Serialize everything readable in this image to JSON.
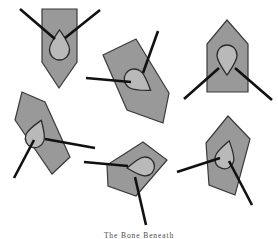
{
  "figure": {
    "title": "",
    "caption": "The Bone Beneath",
    "background_color": "#ffffff",
    "width": 278,
    "height": 239,
    "palette": {
      "polygon_fill": "#999999",
      "polygon_stroke": "#3a3a3a",
      "teardrop_fill": "#b9b9b9",
      "teardrop_stroke": "#2b2b2b",
      "leader_line": "#111111"
    },
    "object_count": 6,
    "leader_lines_per_object": 2,
    "objects": [
      {
        "id": "object-1",
        "name": "shield-top-left",
        "position": "top-left",
        "rotation_deg": 0,
        "polygon_kind": "shield-pointed-bottom",
        "polygon_points": "42,9 77,9 77,62 59,88 42,62",
        "teardrop": {
          "cx": 59.5,
          "cy": 43,
          "rx": 10,
          "ry": 13,
          "rotation_deg": 0
        },
        "leaders": [
          {
            "x1": 20,
            "y1": 9,
            "x2": 55,
            "y2": 39
          },
          {
            "x1": 100,
            "y1": 10,
            "x2": 65,
            "y2": 38
          }
        ]
      },
      {
        "id": "object-2",
        "name": "shield-top-middle",
        "position": "top-middle",
        "rotation_deg": 40,
        "polygon_kind": "shield-pointed-bottom",
        "polygon_points": "136,39 103,55 127,110 163,123 169,93",
        "teardrop": {
          "cx": 140,
          "cy": 83,
          "rx": 10,
          "ry": 12.5,
          "rotation_deg": 125
        },
        "leaders": [
          {
            "x1": 158,
            "y1": 31,
            "x2": 143,
            "y2": 73
          },
          {
            "x1": 86,
            "y1": 78,
            "x2": 131,
            "y2": 82
          }
        ]
      },
      {
        "id": "object-3",
        "name": "shield-top-right",
        "position": "top-right",
        "rotation_deg": 180,
        "polygon_kind": "house-pointed-top",
        "polygon_points": "227,20 248,44 248,92 207,92 207,44",
        "teardrop": {
          "cx": 227,
          "cy": 62,
          "rx": 10,
          "ry": 13,
          "rotation_deg": 180
        },
        "leaders": [
          {
            "x1": 184,
            "y1": 99,
            "x2": 219,
            "y2": 68
          },
          {
            "x1": 272,
            "y1": 100,
            "x2": 235,
            "y2": 68
          }
        ]
      },
      {
        "id": "object-4",
        "name": "shield-bottom-left",
        "position": "bottom-left",
        "rotation_deg": 25,
        "polygon_kind": "shield-pointed-bottom",
        "polygon_points": "22,92 15,120 52,174 70,157 45,102",
        "teardrop": {
          "cx": 37,
          "cy": 132,
          "rx": 9.5,
          "ry": 12.5,
          "rotation_deg": 20
        },
        "leaders": [
          {
            "x1": 95,
            "y1": 148,
            "x2": 45,
            "y2": 139
          },
          {
            "x1": 14,
            "y1": 178,
            "x2": 34,
            "y2": 140
          }
        ]
      },
      {
        "id": "object-5",
        "name": "shield-bottom-middle",
        "position": "bottom-middle",
        "rotation_deg": 300,
        "polygon_kind": "shield-pointed-bottom",
        "polygon_points": "143,142 107,165 108,186 136,196 167,160",
        "teardrop": {
          "cx": 139,
          "cy": 167,
          "rx": 10,
          "ry": 12,
          "rotation_deg": 265
        },
        "leaders": [
          {
            "x1": 84,
            "y1": 162,
            "x2": 128,
            "y2": 166
          },
          {
            "x1": 146,
            "y1": 225,
            "x2": 135,
            "y2": 177
          }
        ]
      },
      {
        "id": "object-6",
        "name": "shield-bottom-right",
        "position": "bottom-right",
        "rotation_deg": 20,
        "polygon_kind": "shield-pointed-bottom",
        "polygon_points": "228,116 206,143 209,185 235,195 250,139",
        "teardrop": {
          "cx": 226,
          "cy": 153,
          "rx": 9.5,
          "ry": 12.5,
          "rotation_deg": 15
        },
        "leaders": [
          {
            "x1": 177,
            "y1": 172,
            "x2": 220,
            "y2": 158
          },
          {
            "x1": 252,
            "y1": 205,
            "x2": 229,
            "y2": 161
          }
        ]
      }
    ]
  }
}
